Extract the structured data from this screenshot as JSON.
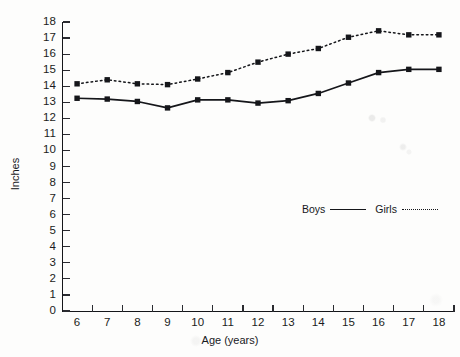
{
  "chart_data": {
    "type": "line",
    "title": "",
    "xlabel": "Age (years)",
    "ylabel": "Inches",
    "xlim": [
      5.5,
      18.5
    ],
    "ylim": [
      0,
      18
    ],
    "grid": false,
    "legend_position": "inside-right",
    "x": [
      6,
      7,
      8,
      9,
      10,
      11,
      12,
      13,
      14,
      15,
      16,
      17,
      18
    ],
    "x_tick_labels": [
      "6",
      "7",
      "8",
      "9",
      "10",
      "11",
      "12",
      "13",
      "14",
      "15",
      "16",
      "17",
      "18"
    ],
    "y_tick_labels": [
      "0",
      "1",
      "2",
      "3",
      "4",
      "5",
      "6",
      "7",
      "8",
      "9",
      "10",
      "11",
      "12",
      "13",
      "14",
      "15",
      "16",
      "17",
      "18"
    ],
    "y_ticks": [
      0,
      1,
      2,
      3,
      4,
      5,
      6,
      7,
      8,
      9,
      10,
      11,
      12,
      13,
      14,
      15,
      16,
      17,
      18
    ],
    "series": [
      {
        "name": "Boys",
        "line_style": "solid",
        "marker": "square",
        "color": "#15161a",
        "values": [
          13.25,
          13.2,
          13.05,
          12.65,
          13.15,
          13.15,
          12.95,
          13.1,
          13.55,
          14.2,
          14.85,
          15.05,
          15.05
        ]
      },
      {
        "name": "Girls",
        "line_style": "dotted",
        "marker": "square",
        "color": "#15161a",
        "values": [
          14.15,
          14.4,
          14.15,
          14.1,
          14.45,
          14.85,
          15.5,
          16.0,
          16.35,
          17.05,
          17.45,
          17.2,
          17.2
        ]
      }
    ],
    "legend": [
      {
        "label": "Boys",
        "line_style": "solid"
      },
      {
        "label": "Girls",
        "line_style": "dotted"
      }
    ]
  },
  "colors": {
    "ink": "#15161a",
    "axis": "#2a2b30",
    "page": "#fdfdfc"
  }
}
